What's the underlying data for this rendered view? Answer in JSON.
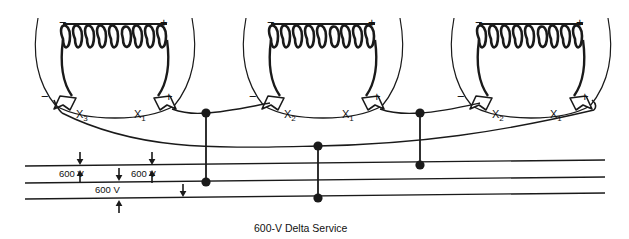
{
  "figure": {
    "caption": "600-V Delta Service",
    "type": "electrical-wiring-diagram",
    "line_color": "#1a1a1a",
    "background": "#ffffff"
  },
  "transformers": [
    {
      "index": 1,
      "left_polarity": "−",
      "right_polarity": "+",
      "lead_left_polarity": "−",
      "lead_right_polarity": "+",
      "terminal_left": "X",
      "terminal_left_sub": "3",
      "terminal_right": "X",
      "terminal_right_sub": "1"
    },
    {
      "index": 2,
      "left_polarity": "−",
      "right_polarity": "+",
      "lead_left_polarity": "−",
      "lead_right_polarity": "+",
      "terminal_left": "X",
      "terminal_left_sub": "2",
      "terminal_right": "X",
      "terminal_right_sub": "1"
    },
    {
      "index": 3,
      "left_polarity": "−",
      "right_polarity": "+",
      "lead_left_polarity": "−",
      "lead_right_polarity": "+",
      "terminal_left": "X",
      "terminal_left_sub": "2",
      "terminal_right": "X",
      "terminal_right_sub": "1"
    }
  ],
  "voltage_labels": [
    {
      "id": "v-left",
      "text": "600 V"
    },
    {
      "id": "v-right",
      "text": "600 V"
    },
    {
      "id": "v-bottom",
      "text": "600 V"
    }
  ],
  "bus_lines": [
    {
      "id": "bus-line-1",
      "name": "phase-a"
    },
    {
      "id": "bus-line-2",
      "name": "phase-b"
    },
    {
      "id": "bus-line-3",
      "name": "phase-c"
    }
  ]
}
